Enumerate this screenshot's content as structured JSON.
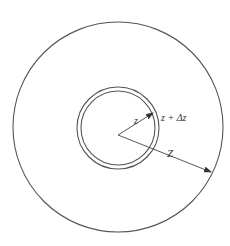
{
  "diagram": {
    "type": "concentric-circles",
    "colors": {
      "stroke": "#555555",
      "text": "#333333",
      "background": "#ffffff"
    },
    "outer_circle": {
      "cx": 118,
      "cy": 127,
      "r": 105
    },
    "shell": {
      "cx": 118,
      "cy": 128,
      "inner_r": 37,
      "outer_r": 41
    },
    "origin": {
      "x": 118,
      "y": 135
    },
    "arrows": [
      {
        "name": "radius-z",
        "to": {
          "x": 153,
          "y": 113
        },
        "label": "z",
        "label_pos": {
          "x": 134,
          "y": 124
        }
      },
      {
        "name": "radius-Z",
        "to": {
          "x": 211,
          "y": 172
        },
        "label": "Z",
        "label_pos": {
          "x": 167,
          "y": 157
        }
      }
    ],
    "shell_label": {
      "text": "z + Δz",
      "pos": {
        "x": 161,
        "y": 121
      }
    }
  }
}
